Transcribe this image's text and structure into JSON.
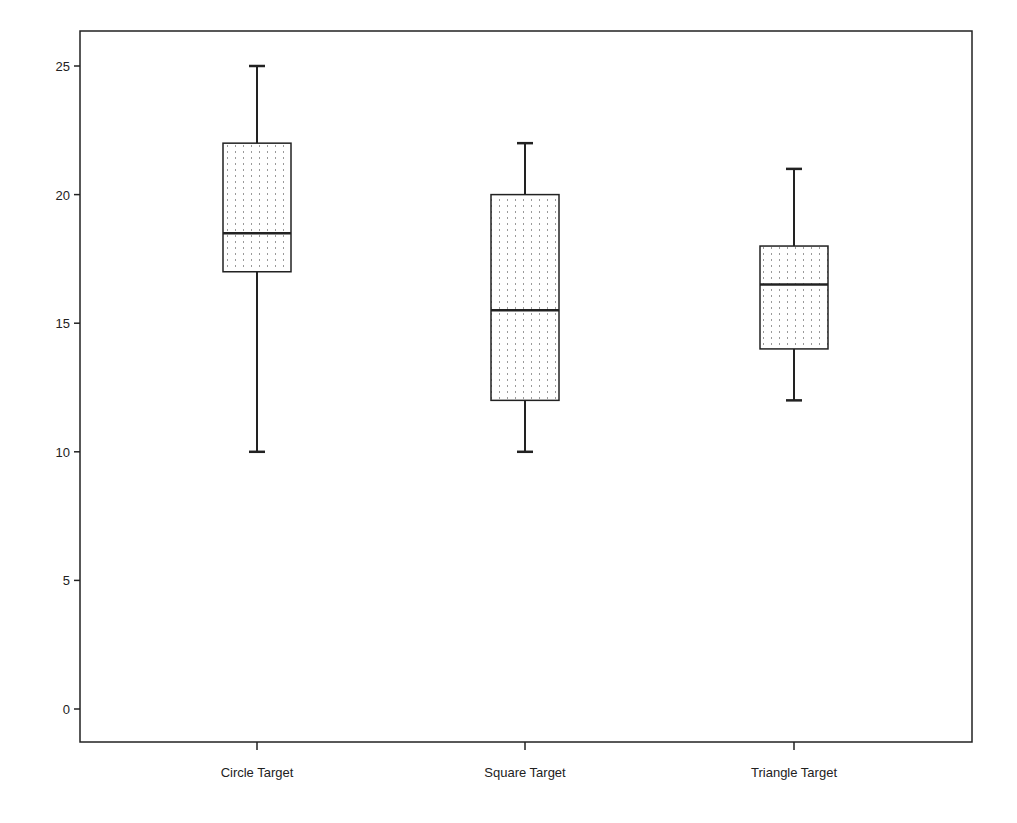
{
  "chart_data": {
    "type": "boxplot",
    "title": "",
    "xlabel": "",
    "ylabel": "",
    "ylim": [
      -1.3,
      26.4
    ],
    "yticks": [
      0,
      5,
      10,
      15,
      20,
      25
    ],
    "grid": false,
    "legend": null,
    "categories": [
      "Circle Target",
      "Square Target",
      "Triangle Target"
    ],
    "series": [
      {
        "name": "Circle Target",
        "min": 10,
        "q1": 17,
        "median": 18.5,
        "q3": 22,
        "max": 25
      },
      {
        "name": "Square Target",
        "min": 10,
        "q1": 12,
        "median": 15.5,
        "q3": 20,
        "max": 22
      },
      {
        "name": "Triangle Target",
        "min": 12,
        "q1": 14,
        "median": 16.5,
        "q3": 18,
        "max": 21
      }
    ],
    "box_fill_pattern": "dotted-vertical",
    "colors": {
      "stroke": "#222222",
      "fill": "#ffffff",
      "dots": "#9a9a9a",
      "background": "#ffffff"
    }
  },
  "axis": {
    "y_labels": [
      "0",
      "5",
      "10",
      "15",
      "20",
      "25"
    ],
    "x_labels": [
      "Circle Target",
      "Square Target",
      "Triangle Target"
    ]
  }
}
